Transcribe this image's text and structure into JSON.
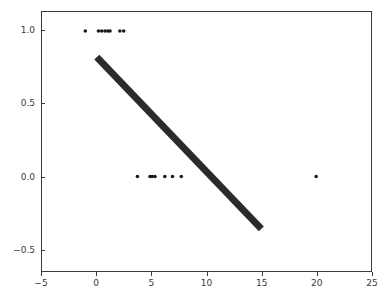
{
  "figure": {
    "width": 387,
    "height": 300,
    "background_color": "#ffffff",
    "axes_color": "#3b3b3b",
    "tick_label_color": "#3b3b3b"
  },
  "axes_box": {
    "left_px": 41,
    "top_px": 11,
    "width_px": 331,
    "height_px": 261
  },
  "chart_data": {
    "type": "scatter",
    "title": "",
    "xlabel": "",
    "ylabel": "",
    "xlim": [
      -5,
      25
    ],
    "ylim": [
      -0.65,
      1.13
    ],
    "grid": false,
    "legend": null,
    "legend_position": "none",
    "xticks": [
      -5,
      0,
      5,
      10,
      15,
      20,
      25
    ],
    "xtick_labels": [
      "−5",
      "0",
      "5",
      "10",
      "15",
      "20",
      "25"
    ],
    "yticks": [
      -0.5,
      0.0,
      0.5,
      1.0
    ],
    "ytick_labels": [
      "−0.5",
      "0.0",
      "0.5",
      "1.0"
    ],
    "series": [
      {
        "name": "observations",
        "type": "scatter",
        "marker": "circle",
        "marker_size_px": 3.6,
        "color": "#1a1a1a",
        "points": [
          {
            "x": -1.05,
            "y": 1.0
          },
          {
            "x": 0.15,
            "y": 1.0
          },
          {
            "x": 0.45,
            "y": 1.0
          },
          {
            "x": 0.75,
            "y": 1.0
          },
          {
            "x": 1.0,
            "y": 1.0
          },
          {
            "x": 1.2,
            "y": 1.0
          },
          {
            "x": 2.1,
            "y": 1.0
          },
          {
            "x": 2.45,
            "y": 1.0
          },
          {
            "x": 3.7,
            "y": 0.0
          },
          {
            "x": 4.85,
            "y": 0.0
          },
          {
            "x": 5.05,
            "y": 0.0
          },
          {
            "x": 5.3,
            "y": 0.0
          },
          {
            "x": 6.2,
            "y": 0.0
          },
          {
            "x": 6.9,
            "y": 0.0
          },
          {
            "x": 7.7,
            "y": 0.0
          },
          {
            "x": 20.0,
            "y": 0.0
          }
        ]
      },
      {
        "name": "fitted-line",
        "type": "line",
        "color": "#2b2b2b",
        "line_width_px": 7,
        "endpoints": [
          {
            "x": 0.0,
            "y": 0.82
          },
          {
            "x": 15.0,
            "y": -0.36
          }
        ]
      }
    ]
  }
}
